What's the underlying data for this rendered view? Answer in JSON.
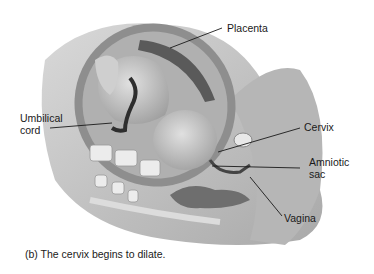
{
  "figure": {
    "caption": "(b) The cervix begins to dilate.",
    "labels": {
      "placenta": "Placenta",
      "umbilical_cord": "Umbilical\ncord",
      "cervix": "Cervix",
      "amniotic_sac": "Amniotic\nsac",
      "vagina": "Vagina"
    }
  },
  "colors": {
    "background": "#ffffff",
    "body_tissue": "#c8c8c8",
    "uterus_wall": "#8e8e8e",
    "placenta": "#5a5a5a",
    "fetus": "#bdbdbd",
    "cord": "#2e2e2e",
    "leader_line": "#1a1a1a"
  }
}
